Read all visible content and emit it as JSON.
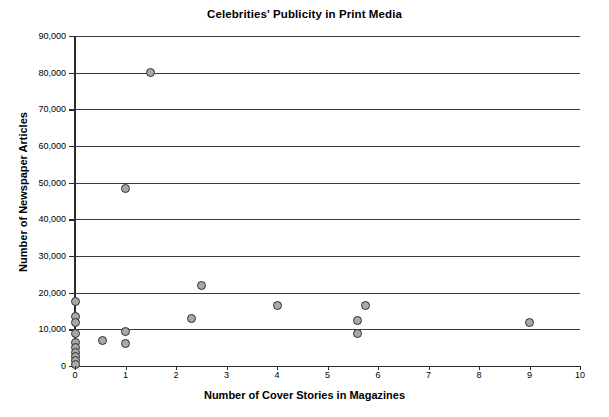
{
  "chart_data": {
    "type": "scatter",
    "title": "Celebrities' Publicity in Print Media",
    "xlabel": "Number of Cover Stories in Magazines",
    "ylabel": "Number of Newspaper Articles",
    "xlim": [
      0,
      10
    ],
    "ylim": [
      0,
      90000
    ],
    "xticks": [
      "0",
      "1",
      "2",
      "3",
      "4",
      "5",
      "6",
      "7",
      "8",
      "9",
      "10"
    ],
    "xtick_values": [
      0,
      1,
      2,
      3,
      4,
      5,
      6,
      7,
      8,
      9,
      10
    ],
    "yticks": [
      "0",
      "10,000",
      "20,000",
      "30,000",
      "40,000",
      "50,000",
      "60,000",
      "70,000",
      "80,000",
      "90,000"
    ],
    "ytick_values": [
      0,
      10000,
      20000,
      30000,
      40000,
      50000,
      60000,
      70000,
      80000,
      90000
    ],
    "grid": "horizontal",
    "legend": "none",
    "marker": {
      "shape": "circle",
      "fill_color": "#a8a8a8",
      "edge_color": "#2f2f2f",
      "size_px": 9
    },
    "axis_color": "#2b2b2b",
    "background_color": "#ffffff",
    "points": [
      {
        "x": 0.0,
        "y": 17500
      },
      {
        "x": 0.0,
        "y": 13500
      },
      {
        "x": 0.0,
        "y": 12000
      },
      {
        "x": 0.0,
        "y": 9000
      },
      {
        "x": 0.0,
        "y": 6500
      },
      {
        "x": 0.0,
        "y": 5000
      },
      {
        "x": 0.0,
        "y": 3800
      },
      {
        "x": 0.0,
        "y": 2600
      },
      {
        "x": 0.0,
        "y": 1500
      },
      {
        "x": 0.0,
        "y": 400
      },
      {
        "x": 0.55,
        "y": 7000
      },
      {
        "x": 1.0,
        "y": 9500
      },
      {
        "x": 1.0,
        "y": 6200
      },
      {
        "x": 1.0,
        "y": 48500
      },
      {
        "x": 1.5,
        "y": 80000
      },
      {
        "x": 2.3,
        "y": 13000
      },
      {
        "x": 2.5,
        "y": 22000
      },
      {
        "x": 4.0,
        "y": 16500
      },
      {
        "x": 5.6,
        "y": 9000
      },
      {
        "x": 5.6,
        "y": 12500
      },
      {
        "x": 5.75,
        "y": 16500
      },
      {
        "x": 9.0,
        "y": 12000
      }
    ]
  }
}
